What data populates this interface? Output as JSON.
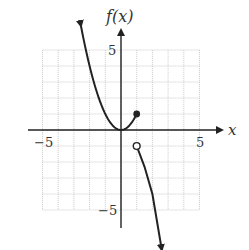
{
  "chart_data": {
    "type": "line",
    "title": "",
    "xlabel": "x",
    "ylabel": "f(x)",
    "xlim": [
      -5,
      5
    ],
    "ylim": [
      -5,
      5
    ],
    "grid": true,
    "x_ticks_labeled": [
      {
        "value": -5,
        "label": "−5"
      },
      {
        "value": 5,
        "label": "5"
      }
    ],
    "y_ticks_labeled": [
      {
        "value": 5,
        "label": "5"
      },
      {
        "value": -5,
        "label": "−5"
      }
    ],
    "series": [
      {
        "name": "left piece",
        "formula": "f(x) = x^2, x <= 1",
        "points": [
          [
            -2.55,
            6.5
          ],
          [
            -2,
            4
          ],
          [
            -1,
            1
          ],
          [
            0,
            0
          ],
          [
            0.5,
            0.25
          ],
          [
            1,
            1
          ]
        ],
        "start": "arrow (extends up-left)",
        "end_point": {
          "x": 1,
          "y": 1,
          "marker": "closed"
        }
      },
      {
        "name": "right piece",
        "formula": "f(x) decreasing, x > 1",
        "points": [
          [
            1,
            -1
          ],
          [
            1.5,
            -2.3
          ],
          [
            2,
            -4
          ],
          [
            2.6,
            -7.5
          ]
        ],
        "start_point": {
          "x": 1,
          "y": -1,
          "marker": "open"
        },
        "end": "arrow (extends down)"
      }
    ]
  },
  "labels": {
    "y_axis": "f(x)",
    "x_axis": "x",
    "x_min": "−5",
    "x_max": "5",
    "y_max": "5",
    "y_min": "−5"
  }
}
